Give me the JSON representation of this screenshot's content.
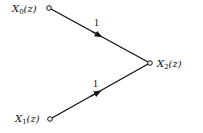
{
  "diagram": {
    "type": "signal-flow-graph",
    "nodes": [
      {
        "id": "x0",
        "label": "X",
        "subscript": "0",
        "arg": "(z)",
        "x": 49,
        "y": 8
      },
      {
        "id": "x1",
        "label": "X",
        "subscript": "1",
        "arg": "(z)",
        "x": 50,
        "y": 119
      },
      {
        "id": "x2",
        "label": "X",
        "subscript": "2",
        "arg": "(z)",
        "x": 150,
        "y": 63
      }
    ],
    "edges": [
      {
        "from": "x0",
        "to": "x2",
        "gain": "1"
      },
      {
        "from": "x1",
        "to": "x2",
        "gain": "1"
      }
    ],
    "colors": {
      "line": "#111111",
      "background": "#ffffff"
    }
  }
}
